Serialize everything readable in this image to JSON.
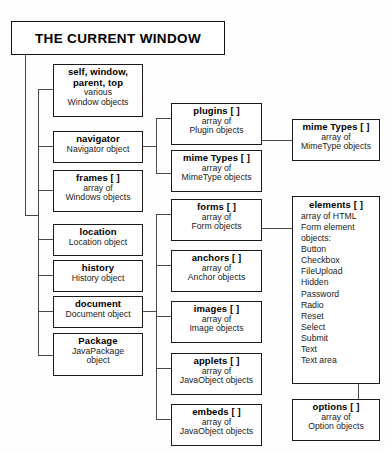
{
  "title": {
    "text": "THE CURRENT WINDOW"
  },
  "colors": {
    "line": "#4a4a4a",
    "border": "#1a1a1a",
    "text": "#000000",
    "background": "#ffffff"
  },
  "columns": {
    "left": [
      {
        "name": "self-window-parent-top",
        "title_line1": "self, window,",
        "title_line2": "parent, top",
        "sub1": "various",
        "sub2": "Window objects"
      },
      {
        "name": "navigator",
        "title_line1": "navigator",
        "sub1": "Navigator object"
      },
      {
        "name": "frames",
        "title_line1": "frames [ ]",
        "sub1": "array of",
        "sub2": "Windows objects"
      },
      {
        "name": "location",
        "title_line1": "location",
        "sub1": "Location object"
      },
      {
        "name": "history",
        "title_line1": "history",
        "sub1": "History object"
      },
      {
        "name": "document",
        "title_line1": "document",
        "sub1": "Document object"
      },
      {
        "name": "package",
        "title_line1": "Package",
        "sub1": "JavaPackage",
        "sub2": "object"
      }
    ],
    "middle": [
      {
        "name": "plugins",
        "title_line1": "plugins [ ]",
        "sub1": "array of",
        "sub2": "Plugin objects"
      },
      {
        "name": "mime-types",
        "title_line1": "mime Types [ ]",
        "sub1": "array of",
        "sub2": "MimeType objects"
      },
      {
        "name": "forms",
        "title_line1": "forms [ ]",
        "sub1": "array of",
        "sub2": "Form objects"
      },
      {
        "name": "anchors",
        "title_line1": "anchors [ ]",
        "sub1": "array of",
        "sub2": "Anchor objects"
      },
      {
        "name": "images",
        "title_line1": "images [ ]",
        "sub1": "array of",
        "sub2": "Image objects"
      },
      {
        "name": "applets",
        "title_line1": "applets [ ]",
        "sub1": "array of",
        "sub2": "JavaObject objects"
      },
      {
        "name": "embeds",
        "title_line1": "embeds [ ]",
        "sub1": "array of",
        "sub2": "JavaObject objects"
      }
    ],
    "right": {
      "mime_types": {
        "title_line1": "mime Types [ ]",
        "sub1": "array of",
        "sub2": "MimeType objects"
      },
      "elements": {
        "title_line1": "elements [ ]",
        "sub1": "array of HTML",
        "sub2": "Form element",
        "sub3": "objects:",
        "items": [
          "Button",
          "Checkbox",
          "FileUpload",
          "Hidden",
          "Password",
          "Radio",
          "Reset",
          "Select",
          "Submit",
          "Text",
          "Text area"
        ]
      },
      "options": {
        "title_line1": "options [ ]",
        "sub1": "array of",
        "sub2": "Option objects"
      }
    }
  }
}
